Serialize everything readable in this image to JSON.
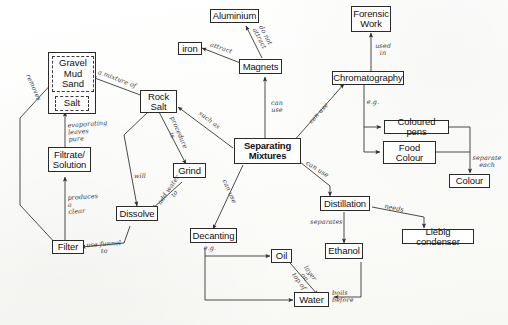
{
  "diagram": {
    "title": "Separating Mixtures",
    "type": "concept-map",
    "ink_color": "#2a2a2a",
    "paper_color": "#fdfdfc"
  },
  "nodes": {
    "aluminium": "Aluminium",
    "iron": "iron",
    "magnets": "Magnets",
    "forensic_work": "Forensic\nWork",
    "chromatography": "Chromatography",
    "coloured_pens": "Coloured pens",
    "food_colour": "Food\nColour",
    "colour": "Colour",
    "gravel_mud_sand": "Gravel\nMud\nSand",
    "salt": "Salt",
    "rock_salt": "Rock\nSalt",
    "filtrate_solution": "Filtrate/\nSolution",
    "filter": "Filter",
    "dissolve": "Dissolve",
    "grind": "Grind",
    "separating_mixtures": "Separating\nMixtures",
    "decanting": "Decanting",
    "oil": "Oil",
    "water": "Water",
    "distillation": "Distillation",
    "ethanol": "Ethanol",
    "liebig_condenser": "Liebig condenser"
  },
  "edge_labels": {
    "do_not_attract": "do not\nattract",
    "attract": "attract",
    "can_use_magnets": "can\nuse",
    "used_in": "used\nin",
    "can_use_chromatography": "can use",
    "eg_chromatography": "e.g.",
    "separate_each": "separate\neach",
    "a_mixture_of": "a mixture of",
    "such_as": "such as",
    "procedure_is": "procedure is",
    "removes": "removes",
    "evaporating_leaves_pure": "evaporating\nleaves\npure",
    "produces_a_clear": "produces\na\nclear",
    "use_funnel_to": "use funnel\nto",
    "will": "will",
    "add_water_to": "add water\nto",
    "can_use_decanting": "can use",
    "eg_decanting": "e.g.",
    "layer_on_top_of": "layer on\ntop of",
    "can_use_distillation": "can use",
    "separates": "separates",
    "needs": "needs",
    "boils_before": "boils\nbefore"
  }
}
